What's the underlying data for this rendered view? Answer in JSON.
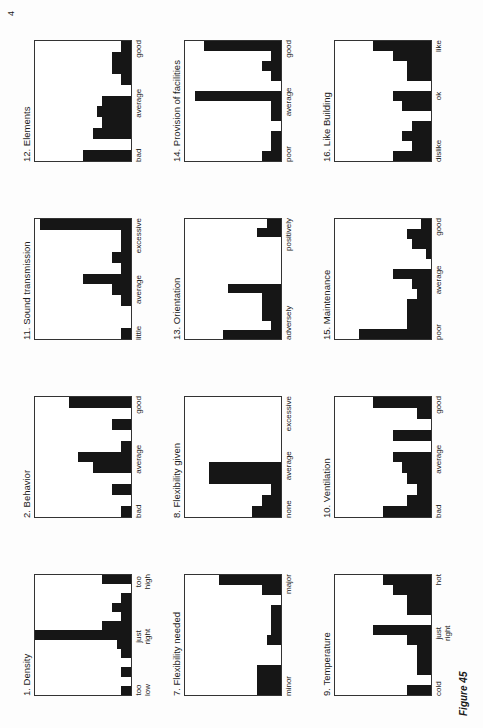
{
  "figure": {
    "label": "Figure 45",
    "corner_mark": "4"
  },
  "chart_data": [
    {
      "type": "bar",
      "title": "1. Density",
      "x_labels": [
        "too\nlow",
        "just\nright",
        "too\nhigh"
      ],
      "values": [
        0.1,
        0,
        0.1,
        0,
        0.1,
        0.15,
        1.0,
        0.3,
        0.1,
        0.2,
        0.1,
        0,
        0.3
      ],
      "ylim": [
        0,
        1
      ]
    },
    {
      "type": "bar",
      "title": "2. Behavior",
      "x_labels": [
        "bad",
        "average",
        "good"
      ],
      "values": [
        0.1,
        0,
        0.2,
        0,
        0.4,
        0.55,
        0.1,
        0,
        0.2,
        0,
        0.65
      ],
      "ylim": [
        0,
        1
      ]
    },
    {
      "type": "bar",
      "title": "11. Sound transmission",
      "x_labels": [
        "little",
        "average",
        "excessive"
      ],
      "values": [
        0.1,
        0,
        0,
        0.1,
        0.2,
        0.5,
        0.1,
        0.2,
        0.1,
        0.1,
        0.95
      ],
      "ylim": [
        0,
        1
      ]
    },
    {
      "type": "bar",
      "title": "12. Elements",
      "x_labels": [
        "bad",
        "average",
        "good"
      ],
      "values": [
        0.5,
        0,
        0.4,
        0.3,
        0.35,
        0.3,
        0,
        0.1,
        0.2,
        0.2,
        0.1
      ],
      "ylim": [
        0,
        1
      ]
    },
    {
      "type": "bar",
      "title": "7. Flexibility needed",
      "x_labels": [
        "minor",
        "major"
      ],
      "values": [
        0.25,
        0.25,
        0.25,
        0,
        0,
        0.15,
        0.1,
        0.1,
        0.1,
        0,
        0.2,
        0.65
      ],
      "ylim": [
        0,
        1
      ]
    },
    {
      "type": "bar",
      "title": "8. Flexibility given",
      "x_labels": [
        "none",
        "average",
        "excessive"
      ],
      "values": [
        0.3,
        0.2,
        0.1,
        0.75,
        0.75,
        0,
        0,
        0,
        0,
        0,
        0
      ],
      "ylim": [
        0,
        1
      ]
    },
    {
      "type": "bar",
      "title": "13. Orientation",
      "x_labels": [
        "adversely",
        "positively"
      ],
      "values": [
        0.6,
        0.1,
        0.2,
        0.2,
        0.2,
        0.55,
        0,
        0,
        0,
        0,
        0,
        0.25,
        0.15
      ],
      "ylim": [
        0,
        1
      ]
    },
    {
      "type": "bar",
      "title": "14. Provision of facilities",
      "x_labels": [
        "poor",
        "average",
        "good"
      ],
      "values": [
        0.2,
        0.1,
        0.1,
        0,
        0.1,
        0.1,
        0.9,
        0,
        0.1,
        0.2,
        0.1,
        0.8
      ],
      "ylim": [
        0,
        1
      ]
    },
    {
      "type": "bar",
      "title": "9. Temperature",
      "x_labels": [
        "cold",
        "just\nright",
        "hot"
      ],
      "values": [
        0.25,
        0,
        0.15,
        0.15,
        0.15,
        0.25,
        0.6,
        0,
        0.25,
        0.25,
        0.4,
        0.5
      ],
      "ylim": [
        0,
        1
      ]
    },
    {
      "type": "bar",
      "title": "10. Ventilation",
      "x_labels": [
        "bad",
        "average",
        "good"
      ],
      "values": [
        0.5,
        0.25,
        0.15,
        0.25,
        0.3,
        0.4,
        0,
        0.4,
        0,
        0.15,
        0.6
      ],
      "ylim": [
        0,
        1
      ]
    },
    {
      "type": "bar",
      "title": "15. Maintenance",
      "x_labels": [
        "poor",
        "average",
        "good"
      ],
      "values": [
        0.75,
        0.25,
        0.25,
        0.25,
        0.15,
        0.2,
        0.4,
        0,
        0.05,
        0.2,
        0.25,
        0.1
      ],
      "ylim": [
        0,
        1
      ]
    },
    {
      "type": "bar",
      "title": "16. Like Building",
      "x_labels": [
        "dislike",
        "ok",
        "like"
      ],
      "values": [
        0.4,
        0.2,
        0.3,
        0.2,
        0,
        0.3,
        0.4,
        0,
        0.25,
        0.25,
        0.4,
        0.6
      ],
      "ylim": [
        0,
        1
      ]
    }
  ]
}
